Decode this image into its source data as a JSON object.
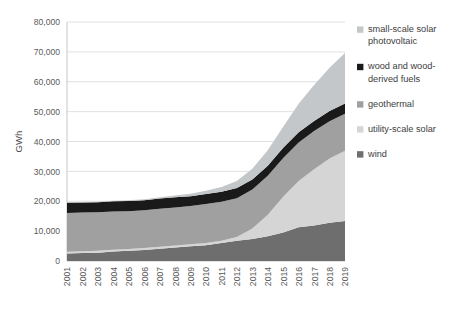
{
  "chart_data": {
    "type": "area",
    "stacked": true,
    "title": "",
    "xlabel": "",
    "ylabel": "GWh",
    "ylim": [
      0,
      80000
    ],
    "ytick_step": 10000,
    "ytick_labels": [
      "0",
      "10,000",
      "20,000",
      "30,000",
      "40,000",
      "50,000",
      "60,000",
      "70,000",
      "80,000"
    ],
    "ytick_values": [
      0,
      10000,
      20000,
      30000,
      40000,
      50000,
      60000,
      70000,
      80000
    ],
    "grid": true,
    "legend_position": "right",
    "categories": [
      "2001",
      "2002",
      "2003",
      "2004",
      "2005",
      "2006",
      "2007",
      "2008",
      "2009",
      "2010",
      "2011",
      "2012",
      "2013",
      "2014",
      "2015",
      "2016",
      "2017",
      "2018",
      "2019"
    ],
    "stack_order_bottom_to_top": [
      "wind",
      "utility-scale solar",
      "geothermal",
      "wood and wood-derived fuels",
      "small-scale solar photovoltaic"
    ],
    "series": [
      {
        "name": "wind",
        "color": "#6e6e6e",
        "values": [
          2500,
          2700,
          2800,
          3200,
          3400,
          3700,
          4100,
          4500,
          4900,
          5300,
          6000,
          6800,
          7400,
          8300,
          9500,
          11300,
          11900,
          12800,
          13400
        ]
      },
      {
        "name": "utility-scale solar",
        "color": "#d5d5d5",
        "values": [
          600,
          600,
          600,
          600,
          650,
          650,
          700,
          700,
          700,
          750,
          800,
          1200,
          3500,
          7200,
          12000,
          15500,
          18800,
          21500,
          23500
        ]
      },
      {
        "name": "geothermal",
        "color": "#a0a0a0",
        "values": [
          13000,
          12900,
          12900,
          12800,
          12600,
          12600,
          12700,
          12700,
          12800,
          13000,
          13000,
          13000,
          13000,
          13000,
          13000,
          12900,
          12800,
          12500,
          12400
        ]
      },
      {
        "name": "wood and wood-derived fuels",
        "color": "#1a1a1a",
        "values": [
          3400,
          3400,
          3400,
          3400,
          3400,
          3400,
          3400,
          3400,
          3300,
          3400,
          3400,
          3400,
          3400,
          3400,
          3400,
          3400,
          3400,
          3400,
          3400
        ]
      },
      {
        "name": "small-scale solar photovoltaic",
        "color": "#c3c7c9",
        "values": [
          100,
          120,
          150,
          200,
          260,
          340,
          450,
          600,
          800,
          1100,
          1600,
          2400,
          3600,
          5200,
          7000,
          9500,
          12000,
          14500,
          16900
        ]
      }
    ],
    "legend": [
      {
        "label_lines": [
          "small-scale solar",
          "photovoltaic"
        ],
        "color": "#c3c7c9"
      },
      {
        "label_lines": [
          "wood and wood-",
          "derived fuels"
        ],
        "color": "#1a1a1a"
      },
      {
        "label_lines": [
          "geothermal"
        ],
        "color": "#a0a0a0"
      },
      {
        "label_lines": [
          "utility-scale solar"
        ],
        "color": "#d5d5d5"
      },
      {
        "label_lines": [
          "wind"
        ],
        "color": "#6e6e6e"
      }
    ]
  }
}
